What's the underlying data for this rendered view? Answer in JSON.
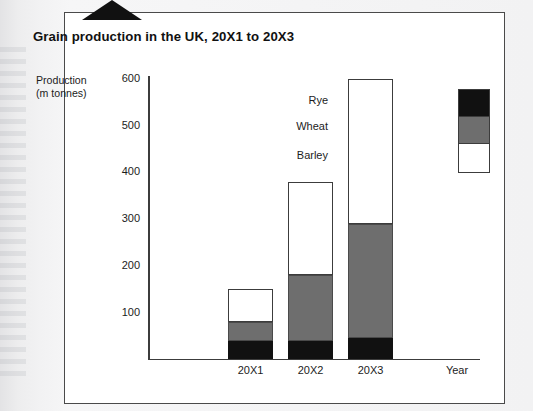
{
  "panel": {
    "title": "Grain production in the UK, 20X1 to 20X3",
    "corner_tab": "dog-ear-tab"
  },
  "chart_data": {
    "type": "bar",
    "stacked": true,
    "title": "Grain production in the UK, 20X1 to 20X3",
    "categories": [
      "20X1",
      "20X2",
      "20X3"
    ],
    "series": [
      {
        "name": "Rye",
        "color": "#111111",
        "values": [
          40,
          40,
          45
        ]
      },
      {
        "name": "Wheat",
        "color": "#6e6e6e",
        "values": [
          40,
          140,
          245
        ]
      },
      {
        "name": "Barley",
        "color": "#ffffff",
        "values": [
          70,
          200,
          310
        ]
      }
    ],
    "totals": [
      150,
      380,
      600
    ],
    "xlabel": "Year",
    "ylabel": "Production (m tonnes)",
    "ylabel_line1": "Production",
    "ylabel_line2": "(m tonnes)",
    "ylim": [
      0,
      620
    ],
    "yticks": [
      100,
      200,
      300,
      400,
      500,
      600
    ],
    "ytick_labels": [
      "100",
      "200",
      "300",
      "400",
      "500",
      "600"
    ],
    "grid": false,
    "legend_position": "right-top",
    "legend_entries": [
      "Rye",
      "Wheat",
      "Barley"
    ]
  }
}
